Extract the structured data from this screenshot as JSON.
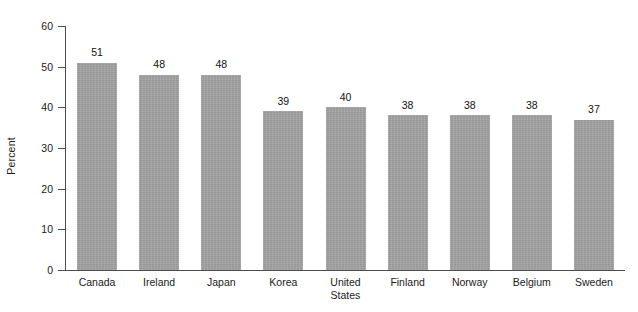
{
  "chart_data": {
    "type": "bar",
    "title": "",
    "subtitle": "",
    "xlabel": "",
    "ylabel": "Percent",
    "categories": [
      "Canada",
      "Ireland",
      "Japan",
      "Korea",
      "United\nStates",
      "Finland",
      "Norway",
      "Belgium",
      "Sweden"
    ],
    "values": [
      51,
      48,
      48,
      39,
      40,
      38,
      38,
      38,
      37
    ],
    "value_labels": [
      "51",
      "48",
      "48",
      "39",
      "40",
      "38",
      "38",
      "38",
      "37"
    ],
    "ylim": [
      0,
      60
    ],
    "ytick_values": [
      0,
      10,
      20,
      30,
      40,
      50,
      60
    ],
    "ytick_labels": [
      "0",
      "10",
      "20",
      "30",
      "40",
      "50",
      "60"
    ],
    "grid": false,
    "legend": false,
    "legend_position": "none",
    "bar_color": "#a2a2a2",
    "axis_color": "#4d4d4d",
    "text_color": "#1a1a1a",
    "background_color": "#ffffff",
    "value_labels_shown": true
  }
}
